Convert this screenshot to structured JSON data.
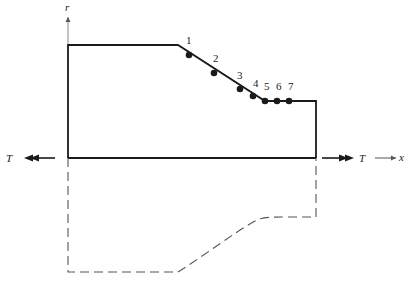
{
  "diagram": {
    "axes": {
      "r_label": "r",
      "x_label": "x"
    },
    "loads": {
      "left_label": "T",
      "right_label": "T"
    },
    "profile": {
      "solid": [
        [
          68,
          158
        ],
        [
          68,
          45
        ],
        [
          178,
          45
        ],
        [
          265,
          101
        ],
        [
          316,
          101
        ],
        [
          316,
          158
        ]
      ],
      "baseline": [
        [
          68,
          158
        ],
        [
          316,
          158
        ]
      ],
      "mirror_dashed": "M68,158 L68,272 L178,272 C205,255 235,232 255,221 C262,217 270,217 285,217 L316,217 L316,158"
    },
    "nodes": [
      {
        "id": "1",
        "x": 189,
        "y": 55,
        "lx": 186,
        "ly": 44
      },
      {
        "id": "2",
        "x": 214,
        "y": 73,
        "lx": 213,
        "ly": 62
      },
      {
        "id": "3",
        "x": 240,
        "y": 89,
        "lx": 237,
        "ly": 79
      },
      {
        "id": "4",
        "x": 253,
        "y": 96,
        "lx": 253,
        "ly": 87
      },
      {
        "id": "5",
        "x": 265,
        "y": 101,
        "lx": 264,
        "ly": 90
      },
      {
        "id": "6",
        "x": 277,
        "y": 101,
        "lx": 276,
        "ly": 90
      },
      {
        "id": "7",
        "x": 289,
        "y": 101,
        "lx": 288,
        "ly": 90
      }
    ],
    "colors": {
      "line": "#1a1a1a",
      "dashed": "#555555",
      "axis": "#888888"
    }
  }
}
